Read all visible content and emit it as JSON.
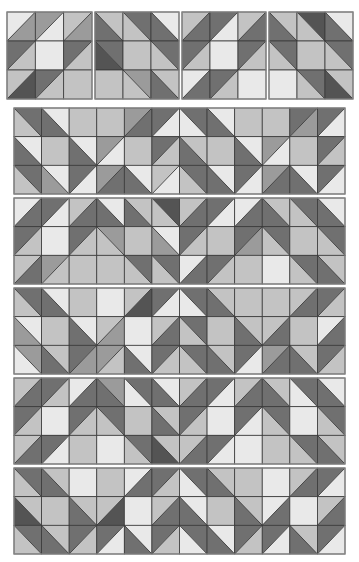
{
  "palette": {
    "K": "#545454",
    "D": "#707070",
    "M": "#9b9b9b",
    "L": "#c3c3c3",
    "W": "#e9e9e9",
    "grid": "#3a3a3a",
    "background": "#ffffff"
  },
  "blocks": [
    {
      "name": "block-1",
      "x": 7,
      "y": 12,
      "w": 85,
      "h": 87,
      "cols": 3,
      "rows": 3,
      "cells": [
        [
          "/W:M",
          "/M:W",
          "/L:M"
        ],
        [
          "/D:L",
          "W",
          "/D:L"
        ],
        [
          "/L:K",
          "/D:L",
          "L"
        ]
      ]
    },
    {
      "name": "block-2",
      "x": 95,
      "y": 12,
      "w": 84,
      "h": 87,
      "cols": 3,
      "rows": 3,
      "cells": [
        [
          "\\L:D",
          "\\D:L",
          "\\W:D"
        ],
        [
          "\\D:K",
          "L",
          "\\D:L"
        ],
        [
          "L",
          "\\M:L",
          "\\L:D"
        ]
      ]
    },
    {
      "name": "block-3",
      "x": 182,
      "y": 12,
      "w": 84,
      "h": 87,
      "cols": 3,
      "rows": 3,
      "cells": [
        [
          "/L:D",
          "/D:W",
          "/L:D"
        ],
        [
          "/D:L",
          "W",
          "/D:L"
        ],
        [
          "/W:D",
          "/D:L",
          "W"
        ]
      ]
    },
    {
      "name": "block-4",
      "x": 269,
      "y": 12,
      "w": 84,
      "h": 87,
      "cols": 3,
      "rows": 3,
      "cells": [
        [
          "\\L:D",
          "\\K:L",
          "\\W:D"
        ],
        [
          "\\D:L",
          "L",
          "\\D:L"
        ],
        [
          "W",
          "\\D:L",
          "\\L:K"
        ]
      ]
    }
  ],
  "panels": [
    {
      "name": "panel-1",
      "x": 14,
      "y": 108,
      "w": 331,
      "h": 86,
      "cols": 12,
      "rows": 3,
      "cells": [
        [
          "\\D:L",
          "\\W:D",
          "L",
          "L",
          "/M:D",
          "/D:W",
          "\\D:W",
          "\\W:D",
          "L",
          "L",
          "/D:M",
          "/D:W"
        ],
        [
          "\\W:D",
          "L",
          "\\W:D",
          "/M:W",
          "L",
          "/D:L",
          "\\L:D",
          "L",
          "\\W:D",
          "/M:W",
          "L",
          "/D:L"
        ],
        [
          "\\D:L",
          "\\W:M",
          "/D:W",
          "/M:D",
          "\\W:D",
          "/L:W",
          "\\D:L",
          "\\W:D",
          "/D:W",
          "/M:D",
          "\\W:D",
          "/D:W"
        ]
      ]
    },
    {
      "name": "panel-2",
      "x": 14,
      "y": 198,
      "w": 331,
      "h": 86,
      "cols": 12,
      "rows": 3,
      "cells": [
        [
          "/W:D",
          "/D:W",
          "/L:D",
          "\\W:D",
          "\\L:D",
          "\\K:L",
          "/L:D",
          "/D:W",
          "/W:D",
          "\\L:D",
          "\\D:L",
          "\\W:D"
        ],
        [
          "/D:L",
          "W",
          "/D:L",
          "\\M:L",
          "L",
          "\\W:M",
          "/D:L",
          "L",
          "/D:M",
          "\\D:L",
          "L",
          "\\D:L"
        ],
        [
          "/L:D",
          "/M:L",
          "L",
          "L",
          "\\D:L",
          "\\D:L",
          "/W:D",
          "/D:L",
          "L",
          "W",
          "\\D:L",
          "\\L:D"
        ]
      ]
    },
    {
      "name": "panel-3",
      "x": 14,
      "y": 288,
      "w": 331,
      "h": 86,
      "cols": 12,
      "rows": 3,
      "cells": [
        [
          "\\D:L",
          "\\W:D",
          "L",
          "W",
          "/L:K",
          "/D:W",
          "\\D:W",
          "\\L:D",
          "L",
          "L",
          "/L:D",
          "/D:L"
        ],
        [
          "\\W:M",
          "L",
          "\\W:D",
          "/L:M",
          "W",
          "/L:D",
          "\\D:L",
          "L",
          "\\L:D",
          "/L:D",
          "L",
          "/W:D"
        ],
        [
          "\\M:W",
          "\\L:D",
          "/D:M",
          "/M:L",
          "\\W:D",
          "/D:L",
          "\\D:L",
          "\\L:D",
          "/D:W",
          "/M:D",
          "\\L:D",
          "/D:L"
        ]
      ]
    },
    {
      "name": "panel-4",
      "x": 14,
      "y": 378,
      "w": 331,
      "h": 86,
      "cols": 12,
      "rows": 3,
      "cells": [
        [
          "/L:D",
          "/D:L",
          "/W:D",
          "\\M:D",
          "\\D:W",
          "\\W:D",
          "/L:D",
          "/D:W",
          "/L:D",
          "\\L:D",
          "\\D:W",
          "\\W:D"
        ],
        [
          "/D:L",
          "W",
          "/D:L",
          "\\D:L",
          "L",
          "\\L:D",
          "/D:L",
          "W",
          "/D:W",
          "\\D:L",
          "W",
          "\\D:L"
        ],
        [
          "/L:D",
          "/D:W",
          "L",
          "W",
          "\\D:L",
          "\\L:K",
          "/L:D",
          "/D:W",
          "W",
          "L",
          "\\D:L",
          "\\L:D"
        ]
      ]
    },
    {
      "name": "panel-5",
      "x": 14,
      "y": 468,
      "w": 331,
      "h": 86,
      "cols": 12,
      "rows": 3,
      "cells": [
        [
          "\\D:L",
          "\\L:D",
          "W",
          "L",
          "/W:D",
          "/D:L",
          "\\D:W",
          "\\L:D",
          "L",
          "W",
          "/L:D",
          "/D:W"
        ],
        [
          "\\L:K",
          "L",
          "\\L:D",
          "/L:K",
          "W",
          "/L:D",
          "\\W:D",
          "L",
          "\\L:D",
          "/W:D",
          "W",
          "/L:D"
        ],
        [
          "\\D:L",
          "\\L:D",
          "/D:L",
          "/D:W",
          "\\W:D",
          "/D:L",
          "\\D:W",
          "\\W:D",
          "/D:L",
          "/D:W",
          "\\L:D",
          "/D:W"
        ]
      ]
    }
  ]
}
